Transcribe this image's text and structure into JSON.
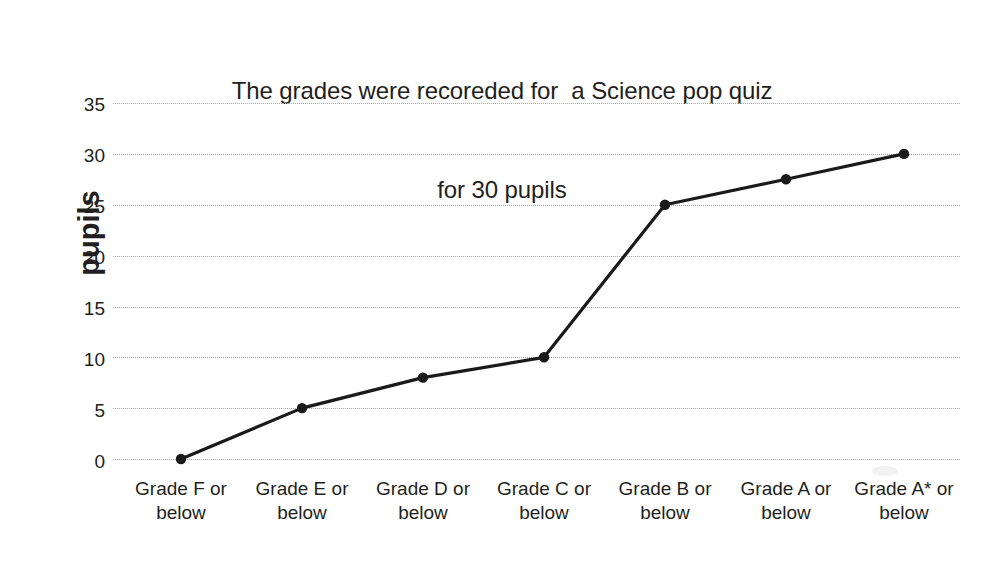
{
  "chart_data": {
    "type": "line",
    "title": "The grades were recoreded for  a Science pop quiz for 30 pupils",
    "title_lines": [
      "The grades were recoreded for  a Science pop quiz",
      "for 30 pupils"
    ],
    "xlabel": "",
    "ylabel": "pupils",
    "categories": [
      "Grade F or below",
      "Grade E or below",
      "Grade D or below",
      "Grade C or below",
      "Grade B or below",
      "Grade A or below",
      "Grade A* or below"
    ],
    "category_lines": [
      [
        "Grade F or",
        "below"
      ],
      [
        "Grade E or",
        "below"
      ],
      [
        "Grade D or",
        "below"
      ],
      [
        "Grade C or",
        "below"
      ],
      [
        "Grade B or",
        "below"
      ],
      [
        "Grade A or",
        "below"
      ],
      [
        "Grade A* or",
        "below"
      ]
    ],
    "values": [
      0,
      5,
      8,
      10,
      25,
      27.5,
      30
    ],
    "ylim": [
      0,
      35
    ],
    "ytick_values": [
      0,
      5,
      10,
      15,
      20,
      25,
      30,
      35
    ],
    "ytick_labels": [
      "0",
      "5",
      "10",
      "15",
      "20",
      "25",
      "30",
      "35"
    ],
    "grid": true,
    "grid_style": "dotted",
    "grid_color": "#a8a8a8",
    "legend": false,
    "legend_position": "none",
    "series": [
      {
        "name": "cumulative pupils",
        "values": [
          0,
          5,
          8,
          10,
          25,
          27.5,
          30
        ],
        "line_color": "#1a1a1a",
        "marker": "circle",
        "marker_color": "#1a1a1a"
      }
    ],
    "annotations": []
  },
  "colors": {
    "background": "#ffffff",
    "text": "#231f20",
    "line": "#1a1a1a",
    "marker": "#1a1a1a",
    "grid": "#a8a8a8"
  }
}
